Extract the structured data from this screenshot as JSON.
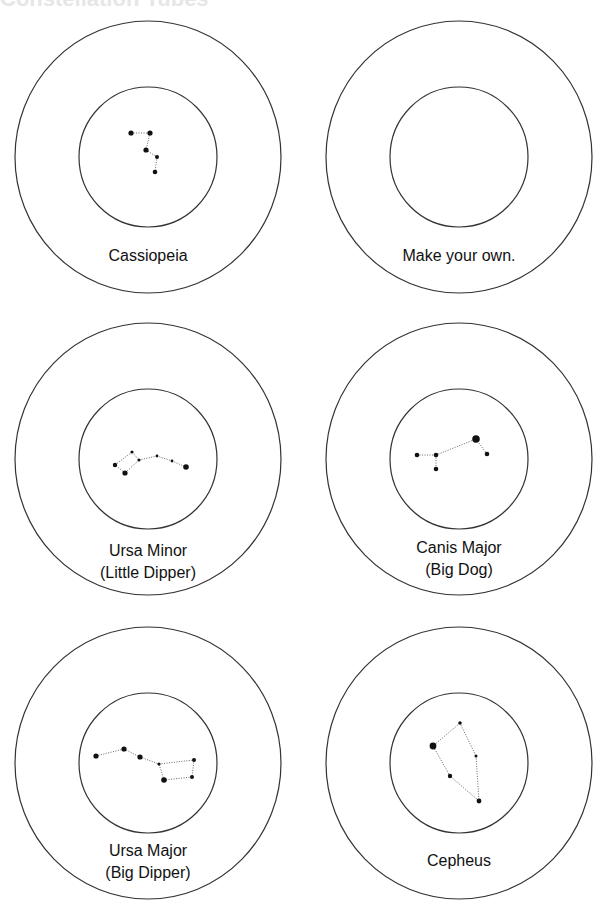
{
  "title": "Constellation Tubes",
  "templates": [
    {
      "name": "cassiopeia",
      "cx": 148,
      "cy": 157,
      "label": [
        "Cassiopeia"
      ],
      "label_y": [
        261
      ],
      "stars": [
        [
          131,
          133,
          2.6
        ],
        [
          150,
          133,
          2.6
        ],
        [
          146,
          150,
          2.6
        ],
        [
          157,
          157,
          2
        ],
        [
          155,
          172,
          2.3
        ]
      ],
      "lines": [
        [
          0,
          1
        ],
        [
          1,
          2
        ],
        [
          2,
          3
        ],
        [
          3,
          4
        ]
      ]
    },
    {
      "name": "make-your-own",
      "cx": 459,
      "cy": 157,
      "label": [
        "Make your own."
      ],
      "label_y": [
        261
      ],
      "stars": [],
      "lines": []
    },
    {
      "name": "ursa-minor",
      "cx": 148,
      "cy": 459,
      "label": [
        "Ursa Minor",
        "(Little Dipper)"
      ],
      "label_y": [
        556,
        578
      ],
      "stars": [
        [
          115,
          465,
          2.2
        ],
        [
          132,
          452,
          1.6
        ],
        [
          139,
          460,
          1.6
        ],
        [
          157,
          456,
          1.4
        ],
        [
          172,
          461,
          1.4
        ],
        [
          186,
          467,
          2.8
        ],
        [
          125,
          473,
          2.6
        ]
      ],
      "lines": [
        [
          0,
          1
        ],
        [
          1,
          2
        ],
        [
          2,
          6
        ],
        [
          6,
          0
        ],
        [
          2,
          3
        ],
        [
          3,
          4
        ],
        [
          4,
          5
        ]
      ]
    },
    {
      "name": "canis-major",
      "cx": 459,
      "cy": 459,
      "label": [
        "Canis Major",
        "(Big Dog)"
      ],
      "label_y": [
        553,
        575
      ],
      "stars": [
        [
          417,
          455,
          2.3
        ],
        [
          436,
          455,
          2.3
        ],
        [
          436,
          469,
          2.3
        ],
        [
          476,
          439,
          3.8
        ],
        [
          487,
          454,
          2.3
        ]
      ],
      "lines": [
        [
          0,
          1
        ],
        [
          1,
          2
        ],
        [
          1,
          3
        ],
        [
          3,
          4
        ]
      ]
    },
    {
      "name": "ursa-major",
      "cx": 148,
      "cy": 763,
      "label": [
        "Ursa Major",
        "(Big Dipper)"
      ],
      "label_y": [
        856,
        878
      ],
      "stars": [
        [
          96,
          756,
          2.6
        ],
        [
          124,
          749,
          2.6
        ],
        [
          140,
          757,
          2.6
        ],
        [
          159,
          764,
          1.6
        ],
        [
          194,
          760,
          2
        ],
        [
          164,
          780,
          2.8
        ],
        [
          192,
          777,
          2
        ]
      ],
      "lines": [
        [
          0,
          1
        ],
        [
          1,
          2
        ],
        [
          2,
          3
        ],
        [
          3,
          4
        ],
        [
          4,
          6
        ],
        [
          6,
          5
        ],
        [
          5,
          3
        ]
      ]
    },
    {
      "name": "cepheus",
      "cx": 459,
      "cy": 763,
      "label": [
        "Cepheus"
      ],
      "label_y": [
        866
      ],
      "stars": [
        [
          460,
          723,
          1.8
        ],
        [
          433,
          746,
          3.4
        ],
        [
          476,
          756,
          1.5
        ],
        [
          450,
          776,
          2.2
        ],
        [
          479,
          801,
          2.4
        ]
      ],
      "lines": [
        [
          0,
          1
        ],
        [
          0,
          2
        ],
        [
          2,
          4
        ],
        [
          4,
          3
        ],
        [
          3,
          1
        ]
      ]
    }
  ],
  "geometry": {
    "outer_rx": 133,
    "outer_ry": 136,
    "inner_rx": 69,
    "inner_ry": 70
  },
  "colors": {
    "stroke": "#333333",
    "star": "#111111",
    "line": "#555555"
  }
}
